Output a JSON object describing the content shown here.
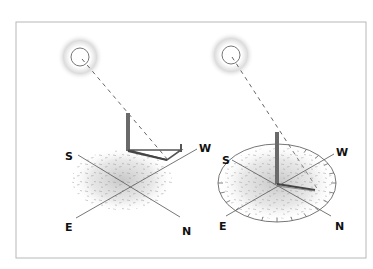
{
  "figure": {
    "frame_color": "#b8b8b8",
    "ink_color": "#555555",
    "left_panel": {
      "compass": {
        "south": "S",
        "west": "W",
        "east": "E",
        "north": "N"
      }
    },
    "right_panel": {
      "compass": {
        "south": "S",
        "west": "W",
        "east": "E",
        "north": "N"
      },
      "dial_ticks": 24
    }
  }
}
